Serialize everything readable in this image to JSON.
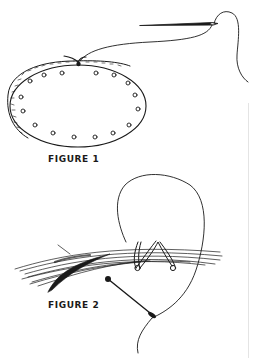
{
  "figures": [
    {
      "caption": "FIGURE 1",
      "depicts": "oval pad with perforated holes being stitched with needle and thread"
    },
    {
      "caption": "FIGURE 2",
      "depicts": "bundle of strands wrapped with thread loops and held by a pin"
    }
  ],
  "colors": {
    "ink": "#1a1a1a",
    "background": "#ffffff",
    "rule": "#e4e4e4"
  }
}
